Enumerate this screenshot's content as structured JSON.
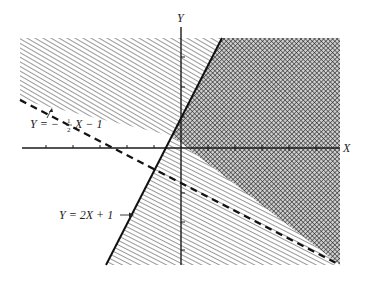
{
  "figure": {
    "type": "linear-inequality-region-graph",
    "axes": {
      "x_label": "X",
      "y_label": "Y",
      "x_ticks_positive": 5,
      "x_ticks_negative": 5,
      "y_ticks_positive": 3,
      "y_ticks_negative": 3
    },
    "lines": [
      {
        "id": "line-solid",
        "equation": "Y = 2X + 1",
        "label": "Y = 2X + 1",
        "style": "solid",
        "label_arrow": "→"
      },
      {
        "id": "line-dashed",
        "equation": "Y = -½X - 1",
        "label_prefix": "Y = −",
        "label_frac_num": "1",
        "label_frac_den": "2",
        "label_suffix": "X − 1",
        "style": "dashed",
        "label_arrow": "↗"
      }
    ],
    "regions": [
      {
        "id": "region-above-dashed-left-of-solid",
        "pattern": "diagonal-hatch",
        "description": "Y > -½X - 1 only"
      },
      {
        "id": "region-overlap",
        "pattern": "cross-hatch",
        "description": "Y > -½X - 1 and Y < 2X + 1"
      },
      {
        "id": "region-below-dashed-right-of-solid",
        "pattern": "horizontal-hatch",
        "description": "Y < 2X + 1 only"
      }
    ],
    "colors": {
      "ink": "#1a1a1a",
      "background": "#ffffff",
      "crosshatch": "#555555"
    }
  }
}
